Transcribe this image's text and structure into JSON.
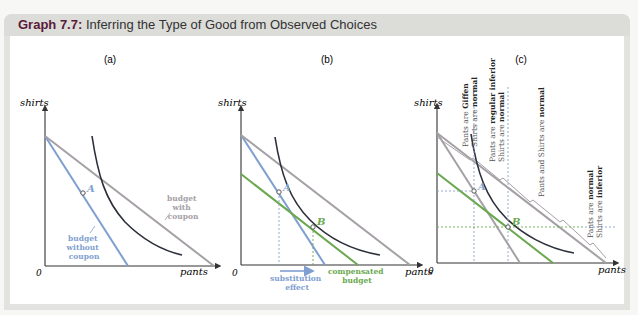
{
  "header": {
    "label": "Graph 7.7:",
    "title": "Inferring the Type of Good from Observed Choices"
  },
  "colors": {
    "title_accent": "#5a1a3a",
    "budget_without": "#7f9fd0",
    "budget_with": "#a5a0a5",
    "compensated": "#6aa84f",
    "indifference": "#2b2f3a",
    "axis": "#333333",
    "guide": "#8aa0cc"
  },
  "panels": [
    {
      "id": "a",
      "label": "(a)",
      "ylabel": "shirts",
      "xlabel": "pants",
      "origin": "0",
      "point_a": "A",
      "budget_with_label": [
        "budget",
        "with",
        "coupon"
      ],
      "budget_without_label": [
        "budget",
        "without",
        "coupon"
      ]
    },
    {
      "id": "b",
      "label": "(b)",
      "ylabel": "shirts",
      "xlabel": "pants",
      "origin": "0",
      "point_a": "A",
      "point_b": "B",
      "substitution_label": [
        "substitution",
        "effect"
      ],
      "compensated_label": [
        "compensated",
        "budget"
      ]
    },
    {
      "id": "c",
      "label": "(c)",
      "ylabel": "shirts",
      "xlabel": "pants",
      "origin": "0",
      "point_a": "A",
      "point_b": "B",
      "regions": [
        {
          "line1_pre": "Pants are ",
          "line1_bold": "Giffen",
          "line2_pre": "Shirts are ",
          "line2_bold": "normal"
        },
        {
          "line1_pre": "Pants are ",
          "line1_bold": "regular inferior",
          "line2_pre": "Shirts are ",
          "line2_bold": "normal"
        },
        {
          "line1_pre": "Pants and Shirts are ",
          "line1_bold": "normal"
        },
        {
          "line1_pre": "Pants are ",
          "line1_bold": "normal",
          "line2_pre": "Shirts are ",
          "line2_bold": "inferior"
        }
      ]
    }
  ]
}
